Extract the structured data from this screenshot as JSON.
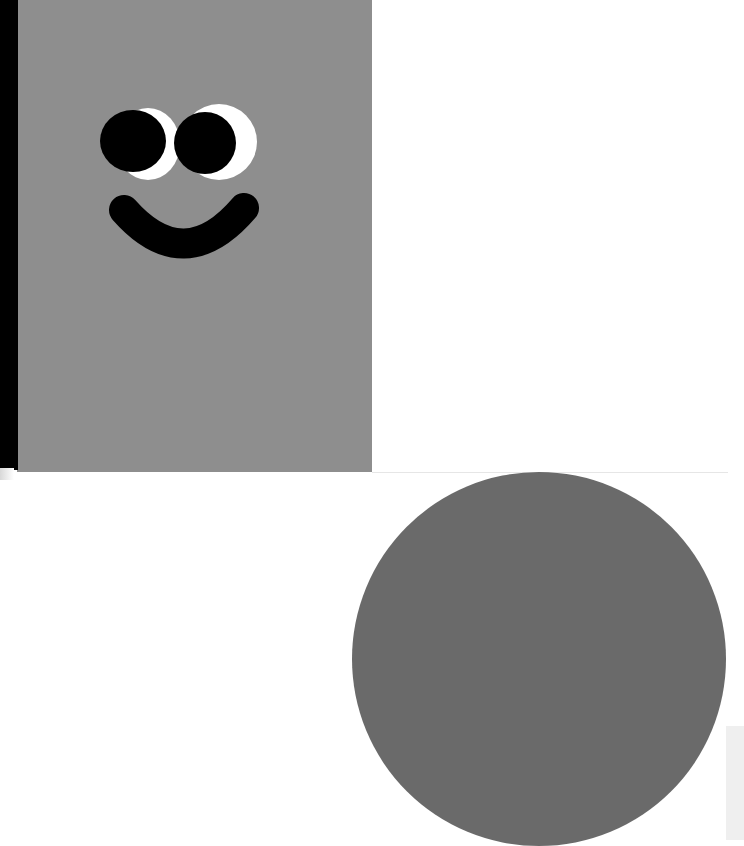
{
  "scene": {
    "description": "Illustration: gray rectangle with smiley face and a gray circle",
    "colors": {
      "background": "#ffffff",
      "panel": "#8e8e8e",
      "strip": "#000000",
      "circle": "#6a6a6a",
      "eye_white": "#ffffff",
      "pupil": "#000000",
      "mouth": "#000000",
      "edge": "#efefef"
    },
    "elements": [
      {
        "name": "gray-panel",
        "x": 17,
        "y": 0,
        "w": 355,
        "h": 472
      },
      {
        "name": "black-strip",
        "x": 0,
        "y": 0,
        "w": 18,
        "h": 470
      },
      {
        "name": "circle",
        "cx": 539,
        "cy": 659,
        "r": 187
      }
    ]
  }
}
